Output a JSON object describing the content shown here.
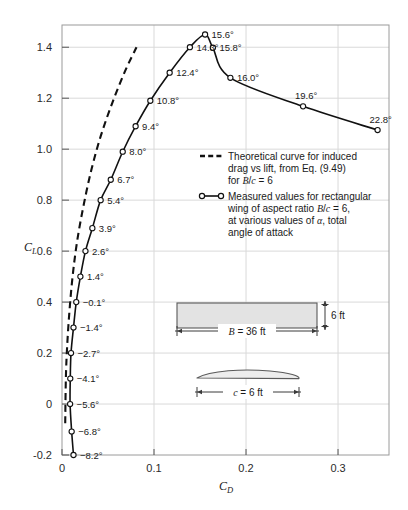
{
  "chart_data": {
    "type": "line",
    "title": "",
    "xlabel": "C_D",
    "ylabel": "C_L",
    "xlim": [
      0,
      0.3554
    ],
    "ylim": [
      -0.2,
      1.4872
    ],
    "xticks": [
      0,
      0.1,
      0.2,
      0.3
    ],
    "xticklabels": [
      "0",
      "0.1",
      "0.2",
      "0.3"
    ],
    "yticks": [
      -0.2,
      0,
      0.2,
      0.4,
      0.6,
      0.8,
      1.0,
      1.2,
      1.4
    ],
    "yticklabels": [
      "-0.2",
      "0",
      "0.2",
      "0.4",
      "0.6",
      "0.8",
      "1.0",
      "1.2",
      "1.4"
    ],
    "grid": true,
    "legend_position": "center-right",
    "series": [
      {
        "name": "Theoretical curve for induced drag vs lift, from Eq. (9.49) for B/c = 6",
        "style": "dashed",
        "marker": "none",
        "color": "#111111",
        "points": [
          {
            "cd": 0.0035,
            "cl": -0.075
          },
          {
            "cd": 0.0042,
            "cl": 0.1
          },
          {
            "cd": 0.0055,
            "cl": 0.22
          },
          {
            "cd": 0.008,
            "cl": 0.36
          },
          {
            "cd": 0.0115,
            "cl": 0.5
          },
          {
            "cd": 0.0165,
            "cl": 0.64
          },
          {
            "cd": 0.0235,
            "cl": 0.78
          },
          {
            "cd": 0.032,
            "cl": 0.92
          },
          {
            "cd": 0.042,
            "cl": 1.05
          },
          {
            "cd": 0.0545,
            "cl": 1.18
          },
          {
            "cd": 0.069,
            "cl": 1.31
          },
          {
            "cd": 0.081,
            "cl": 1.4
          }
        ]
      },
      {
        "name": "Measured values for rectangular wing of aspect ratio B/c = 6, at various values of α, total angle of attack",
        "style": "solid",
        "marker": "open-circle",
        "color": "#111111",
        "points": [
          {
            "alpha": "−8.2°",
            "cd": 0.0125,
            "cl": -0.2,
            "label_side": "right"
          },
          {
            "alpha": "−6.8°",
            "cd": 0.0105,
            "cl": -0.108,
            "label_side": "right"
          },
          {
            "alpha": "−5.6°",
            "cd": 0.0088,
            "cl": 0.0,
            "label_side": "right"
          },
          {
            "alpha": "−4.1°",
            "cd": 0.009,
            "cl": 0.1,
            "label_side": "right"
          },
          {
            "alpha": "−2.7°",
            "cd": 0.0098,
            "cl": 0.2,
            "label_side": "right"
          },
          {
            "alpha": "−1.4°",
            "cd": 0.0125,
            "cl": 0.3,
            "label_side": "right"
          },
          {
            "alpha": "−0.1°",
            "cd": 0.0155,
            "cl": 0.4,
            "label_side": "right"
          },
          {
            "alpha": "1.4°",
            "cd": 0.02,
            "cl": 0.5,
            "label_side": "right"
          },
          {
            "alpha": "2.6°",
            "cd": 0.0255,
            "cl": 0.6,
            "label_side": "right"
          },
          {
            "alpha": "3.9°",
            "cd": 0.033,
            "cl": 0.69,
            "label_side": "right"
          },
          {
            "alpha": "5.4°",
            "cd": 0.042,
            "cl": 0.8,
            "label_side": "right"
          },
          {
            "alpha": "6.7°",
            "cd": 0.053,
            "cl": 0.88,
            "label_side": "right"
          },
          {
            "alpha": "8.0°",
            "cd": 0.066,
            "cl": 0.99,
            "label_side": "right"
          },
          {
            "alpha": "9.4°",
            "cd": 0.08,
            "cl": 1.09,
            "label_side": "right"
          },
          {
            "alpha": "10.8°",
            "cd": 0.096,
            "cl": 1.19,
            "label_side": "right"
          },
          {
            "alpha": "12.4°",
            "cd": 0.117,
            "cl": 1.3,
            "label_side": "right"
          },
          {
            "alpha": "14.3°",
            "cd": 0.139,
            "cl": 1.4,
            "label_side": "right"
          },
          {
            "alpha": "15.6°",
            "cd": 0.1555,
            "cl": 1.45,
            "label_side": "right"
          },
          {
            "alpha": "15.8°",
            "cd": 0.164,
            "cl": 1.398,
            "label_side": "right"
          },
          {
            "alpha": "16.0°",
            "cd": 0.183,
            "cl": 1.28,
            "label_side": "right"
          },
          {
            "alpha": "19.6°",
            "cd": 0.262,
            "cl": 1.168,
            "label_side": "above"
          },
          {
            "alpha": "22.8°",
            "cd": 0.343,
            "cl": 1.075,
            "label_side": "above"
          }
        ]
      }
    ]
  },
  "legend": {
    "entry_theoretical": {
      "symbol": "dashed-line",
      "lines": [
        "Theoretical curve for induced",
        "drag vs lift, from Eq. (9.49)",
        "for B/c = 6"
      ]
    },
    "entry_measured": {
      "symbol": "circle-line-circle",
      "lines": [
        "Measured values for rectangular",
        "wing of aspect ratio B/c = 6,",
        "at various values of α, total",
        "angle of attack"
      ]
    }
  },
  "inset": {
    "planform": {
      "span_label": "B = 36 ft",
      "chord_label": "6 ft",
      "fill_color": "#e3e3e3",
      "stroke_color": "#5a5a5a"
    },
    "airfoil": {
      "chord_label": "c = 6 ft",
      "fill_color": "#ededed",
      "stroke_color": "#5a5a5a"
    }
  },
  "colors": {
    "curve": "#111111",
    "grid": "#d9d9d9",
    "frame": "#9a9a9a",
    "text": "#1a1a1a",
    "tick_text": "#2b2b2b"
  }
}
